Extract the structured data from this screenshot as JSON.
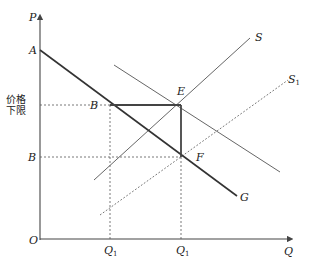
{
  "diagram": {
    "type": "supply-demand price floor diagram",
    "axes": {
      "y_label": "P",
      "x_label": "Q",
      "origin_label": "O"
    },
    "points": {
      "A": "A",
      "B_upper": "B",
      "B_lower": "B",
      "E": "E",
      "F": "F",
      "G": "G"
    },
    "curves": {
      "S": "S",
      "S1_main": "S",
      "S1_sub": "1"
    },
    "price_floor_label_line1": "价格",
    "price_floor_label_line2": "下限",
    "ticks": {
      "q1_main": "Q",
      "q1_sub": "1",
      "q2_main": "Q",
      "q2_sub": "1"
    },
    "colors": {
      "line": "#333333",
      "thin_line": "#555555",
      "dashed": "#666666"
    }
  }
}
